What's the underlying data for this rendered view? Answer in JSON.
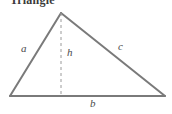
{
  "figure": {
    "heading": "Triangle",
    "width": 172,
    "height": 114,
    "background_color": "#ffffff",
    "stroke_color": "#7a7a7a",
    "label_color": "#4a4a4a",
    "heading_color": "#3a3a3a"
  },
  "geometry": {
    "apex": {
      "x": 61,
      "y": 13
    },
    "bottom_left": {
      "x": 10,
      "y": 96
    },
    "bottom_right": {
      "x": 165,
      "y": 96
    },
    "altitude_foot": {
      "x": 61,
      "y": 96
    },
    "stroke_width": 2,
    "dash_pattern": "3 3"
  },
  "labels": {
    "side_a": "a",
    "side_b": "b",
    "side_c": "c",
    "height_h": "h"
  }
}
